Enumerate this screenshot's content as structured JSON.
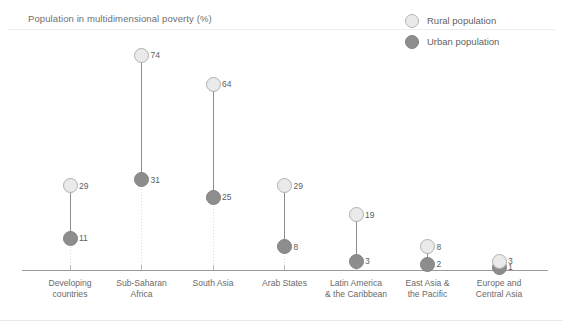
{
  "chart_data": {
    "type": "scatter",
    "title": "Population in multidimensional poverty (%)",
    "xlabel": "",
    "ylabel": "",
    "ylim": [
      0,
      80
    ],
    "grid": true,
    "legend_position": "top-right",
    "categories": [
      "Developing countries",
      "Sub-Saharan Africa",
      "South Asia",
      "Arab States",
      "Latin America & the Caribbean",
      "East Asia & the Pacific",
      "Europe and Central Asia"
    ],
    "category_lines": [
      [
        "Developing",
        "countries"
      ],
      [
        "Sub-Saharan",
        "Africa"
      ],
      [
        "South Asia",
        ""
      ],
      [
        "Arab States",
        ""
      ],
      [
        "Latin America",
        "& the Caribbean"
      ],
      [
        "East Asia &",
        "the Pacific"
      ],
      [
        "Europe and",
        "Central Asia"
      ]
    ],
    "series": [
      {
        "name": "Rural population",
        "color": "#eaeaea",
        "values": [
          29,
          74,
          64,
          29,
          19,
          8,
          3
        ]
      },
      {
        "name": "Urban population",
        "color": "#8d8d8d",
        "values": [
          11,
          31,
          25,
          8,
          3,
          2,
          1
        ]
      }
    ]
  },
  "title": "Population in multidimensional poverty (%)",
  "legend": {
    "items": [
      {
        "label": "Rural population",
        "marker": "rural-circle-icon"
      },
      {
        "label": "Urban population",
        "marker": "urban-circle-icon"
      }
    ]
  }
}
